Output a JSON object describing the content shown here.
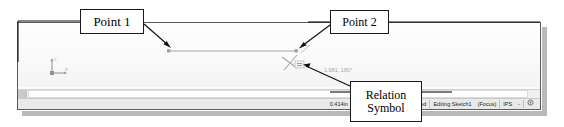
{
  "callouts": {
    "point1": "Point 1",
    "point2": "Point 2",
    "relation_line1": "Relation",
    "relation_line2": "Symbol"
  },
  "cad_window": {
    "view_label": "*Front",
    "dimension_annotation": "1.981, 180°",
    "axis_triad": {
      "y_label": "Y",
      "x_label": "X"
    }
  },
  "status_bar": {
    "coord_x": "0.414in",
    "coord_y": "-2.76in",
    "coord_z": "0in",
    "sketch_state": "Under Defined",
    "editing_state": "Editing Sketch1",
    "focus_text": "(Focus)",
    "units": "IPS",
    "units_dropdown": "-",
    "options_icon": "gear-icon"
  },
  "colors": {
    "window_border": "#5a5a5a",
    "callout_border": "#1a1a1a",
    "status_bg": "#e9e9e9",
    "canvas_bg": "#fcfcfc",
    "leader_line": "#111111",
    "sketch_line": "#3b3b3b"
  }
}
